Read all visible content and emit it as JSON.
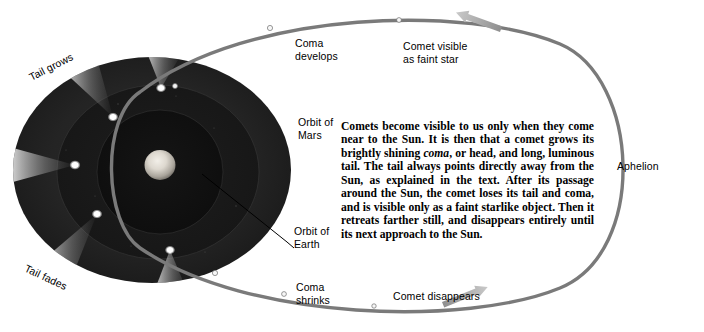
{
  "figure": {
    "kind": "comet-orbit-diagram",
    "background_color": "#ffffff",
    "ink_color": "#000000",
    "orbit_line_color": "#7a7a7a",
    "arrow_color": "#9a9a9a",
    "disk_outer_color": "#242424",
    "disk_mid_color": "#1b1b1b",
    "disk_inner_color": "#121212",
    "sun_color": "#d8d4cc",
    "comet_head_color": "#ffffff",
    "marker_dot_color": "#f2f2f2"
  },
  "labels": {
    "tail_grows": "Tail grows",
    "tail_fades": "Tail fades",
    "coma_develops": "Coma\ndevelops",
    "coma_shrinks": "Coma\nshrinks",
    "comet_visible": "Comet visible\nas faint star",
    "comet_disappears": "Comet disappears",
    "aphelion": "Aphelion",
    "orbit_of_mars": "Orbit of\nMars",
    "orbit_of_earth": "Orbit of\nEarth"
  },
  "caption": {
    "line_1": "Comets become visible to us only when they come",
    "line_2": "near to the Sun. It is then that a comet grows its",
    "line_3_a": "brightly shining ",
    "line_3_italic": "coma",
    "line_3_b": ", or head, and long, luminous",
    "line_4": "tail. The tail always points directly away from the",
    "line_5": "Sun, as explained in the text. After its passage",
    "line_6": "around the Sun, the comet loses its tail and coma, and",
    "line_7": "is visible only as a faint starlike object. Then it",
    "line_8": "retreats farther still, and disappears entirely until its",
    "line_9": "next approach to the Sun.",
    "full_text": "Comets become visible to us only when they come near to the Sun. It is then that a comet grows its brightly shining coma, or head, and long, luminous tail. The tail always points directly away from the Sun, as explained in the text. After its passage around the Sun, the comet loses its tail and coma, and is visible only as a faint starlike object. Then it retreats farther still, and disappears entirely until its next approach to the Sun."
  },
  "orbit": {
    "direction_arrow_top": "arrow-pointing-left",
    "direction_arrow_bottom": "arrow-pointing-right",
    "marker_count": 6
  },
  "comets": [
    {
      "id": "comet-1",
      "head_x": 161,
      "head_y": 88,
      "tail_angle_deg": 247,
      "tail_length": 34
    },
    {
      "id": "comet-2",
      "head_x": 113,
      "head_y": 117,
      "tail_angle_deg": 228,
      "tail_length": 58
    },
    {
      "id": "comet-3",
      "head_x": 75,
      "head_y": 165,
      "tail_angle_deg": 188,
      "tail_length": 66
    },
    {
      "id": "comet-4",
      "head_x": 97,
      "head_y": 214,
      "tail_angle_deg": 152,
      "tail_length": 60
    },
    {
      "id": "comet-5",
      "head_x": 170,
      "head_y": 250,
      "tail_angle_deg": 110,
      "tail_length": 40
    }
  ]
}
